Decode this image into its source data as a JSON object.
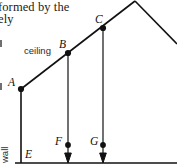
{
  "page": {
    "width": 177,
    "height": 168,
    "background": "#ffffff",
    "ink": "#111111"
  },
  "text_fragments": [
    {
      "name": "line-1",
      "text": "formed by the"
    },
    {
      "name": "line-2",
      "text": "ely"
    }
  ],
  "figure": {
    "points": [
      {
        "id": "A",
        "label": "A",
        "x": 21,
        "y": 89,
        "marker": "filled-dot",
        "label_x": 8,
        "label_y": 78
      },
      {
        "id": "B",
        "label": "B",
        "x": 68,
        "y": 53,
        "marker": "filled-dot",
        "label_x": 59,
        "label_y": 40
      },
      {
        "id": "C",
        "label": "C",
        "x": 103,
        "y": 28,
        "marker": "filled-dot",
        "label_x": 95,
        "label_y": 15
      },
      {
        "id": "E",
        "label": "E",
        "x": 21,
        "y": 163,
        "marker": "none",
        "label_x": 25,
        "label_y": 149
      },
      {
        "id": "F",
        "label": "F",
        "x": 68,
        "y": 145,
        "marker": "filled-dot",
        "label_x": 55,
        "label_y": 136
      },
      {
        "id": "G",
        "label": "G",
        "x": 103,
        "y": 145,
        "marker": "filled-dot",
        "label_x": 90,
        "label_y": 136
      }
    ],
    "material_labels": [
      {
        "id": "ceiling",
        "text": "ceiling",
        "x": 24,
        "y": 51,
        "orientation": "horizontal"
      },
      {
        "id": "wall",
        "text": "wall",
        "x": 10,
        "y": 145,
        "orientation": "vertical-up"
      }
    ],
    "segments": [
      {
        "id": "rafter-A-to-apex",
        "from": [
          21,
          89
        ],
        "to": [
          135,
          1
        ],
        "kind": "roof-line"
      },
      {
        "id": "rafter-apex-right",
        "from": [
          135,
          1
        ],
        "to": [
          176,
          43
        ],
        "kind": "roof-line"
      },
      {
        "id": "wall-A-to-E",
        "from": [
          21,
          89
        ],
        "to": [
          21,
          163
        ],
        "kind": "wall-line"
      },
      {
        "id": "ground-line",
        "from": [
          16,
          163
        ],
        "to": [
          177,
          163
        ],
        "kind": "ground-line"
      },
      {
        "id": "hanger-B-to-F",
        "from": [
          68,
          53
        ],
        "to": [
          68,
          145
        ],
        "kind": "hanger"
      },
      {
        "id": "hanger-C-to-G",
        "from": [
          103,
          28
        ],
        "to": [
          103,
          145
        ],
        "kind": "hanger"
      }
    ],
    "force_arrows": [
      {
        "id": "force-at-F",
        "x": 68,
        "from_y": 145,
        "to_y": 162
      },
      {
        "id": "force-at-G",
        "x": 103,
        "from_y": 145,
        "to_y": 162
      }
    ],
    "apex": {
      "x": 135,
      "y": 1
    }
  }
}
